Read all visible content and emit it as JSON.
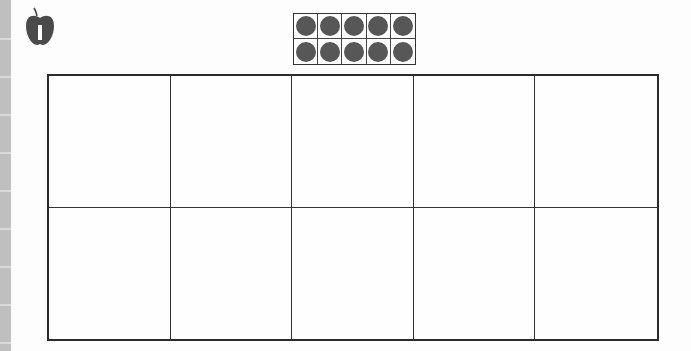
{
  "worksheet": {
    "icon": "apple-icon",
    "ten_frame": {
      "rows": 2,
      "cols": 5,
      "filled": [
        true,
        true,
        true,
        true,
        true,
        true,
        true,
        true,
        true,
        true
      ],
      "count": 10,
      "dot_color": "#575757"
    },
    "answer_grid": {
      "rows": 2,
      "cols": 5,
      "cells": [
        "",
        "",
        "",
        "",
        "",
        "",
        "",
        "",
        "",
        ""
      ]
    }
  },
  "colors": {
    "line": "#2b2b2b",
    "side_strip": "#bfbfbf",
    "background": "#fdfdfd"
  }
}
